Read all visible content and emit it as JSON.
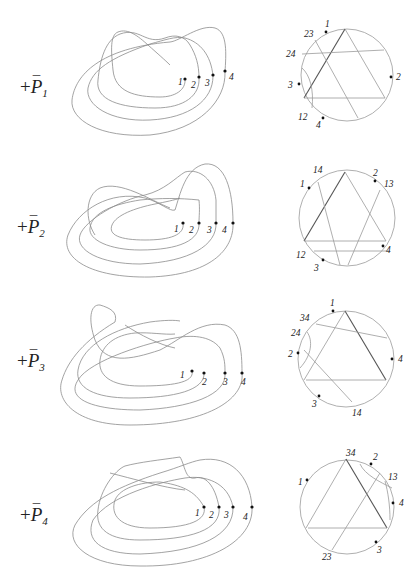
{
  "figure": {
    "rows": [
      {
        "label": {
          "sign": "+",
          "symbol": "P",
          "bar": "¯",
          "index": "1"
        },
        "curve_points": [
          "1",
          "2",
          "3",
          "4"
        ],
        "gauss_diagram": {
          "points": [
            "1",
            "2",
            "3",
            "4"
          ],
          "chord_labels": [
            "23",
            "24",
            "12"
          ]
        }
      },
      {
        "label": {
          "sign": "+",
          "symbol": "P",
          "bar": "¯",
          "index": "2"
        },
        "curve_points": [
          "1",
          "2",
          "3",
          "4"
        ],
        "gauss_diagram": {
          "points": [
            "1",
            "2",
            "3",
            "4"
          ],
          "chord_labels": [
            "14",
            "13",
            "12"
          ]
        }
      },
      {
        "label": {
          "sign": "+",
          "symbol": "P",
          "bar": "¯",
          "index": "3"
        },
        "curve_points": [
          "1",
          "2",
          "3",
          "4"
        ],
        "gauss_diagram": {
          "points": [
            "1",
            "2",
            "3",
            "4"
          ],
          "chord_labels": [
            "34",
            "24",
            "14"
          ]
        }
      },
      {
        "label": {
          "sign": "+",
          "symbol": "P",
          "bar": "¯",
          "index": "4"
        },
        "curve_points": [
          "1",
          "2",
          "3",
          "4"
        ],
        "gauss_diagram": {
          "points": [
            "1",
            "2",
            "3",
            "4"
          ],
          "chord_labels": [
            "34",
            "13",
            "23"
          ]
        }
      }
    ]
  }
}
